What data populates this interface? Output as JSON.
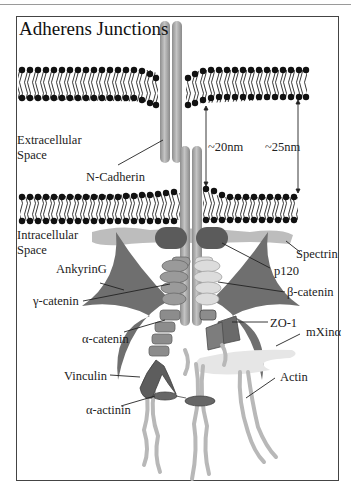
{
  "title": "Adherens Junctions",
  "regions": {
    "extracellular": [
      "Extracellular",
      "Space"
    ],
    "intracellular": [
      "Intracellular",
      "Space"
    ]
  },
  "measurements": {
    "inner_gap": "~20nm",
    "outer_gap": "~25nm"
  },
  "labels": {
    "n_cadherin": "N-Cadherin",
    "spectrin": "Spectrin",
    "p120": "p120",
    "ankyring": "AnkyrinG",
    "gamma_catenin": "γ-catenin",
    "beta_catenin": "β-catenin",
    "alpha_catenin": "α-catenin",
    "zo1": "ZO-1",
    "mxin_alpha": "mXinα",
    "vinculin": "Vinculin",
    "actin": "Actin",
    "alpha_actinin": "α-actinin"
  },
  "colors": {
    "cadherin": "#a9a9a9",
    "lipid_head": "#111111",
    "ankyrin": "#6f6f6f",
    "p120": "#5b5b5b",
    "spectrin": "#bdbdbd",
    "gamma_catenin": "#9a9a9a",
    "beta_catenin": "#dcdcdc",
    "actin": "#b8b8b8",
    "mxin": "#e6e6e6"
  }
}
